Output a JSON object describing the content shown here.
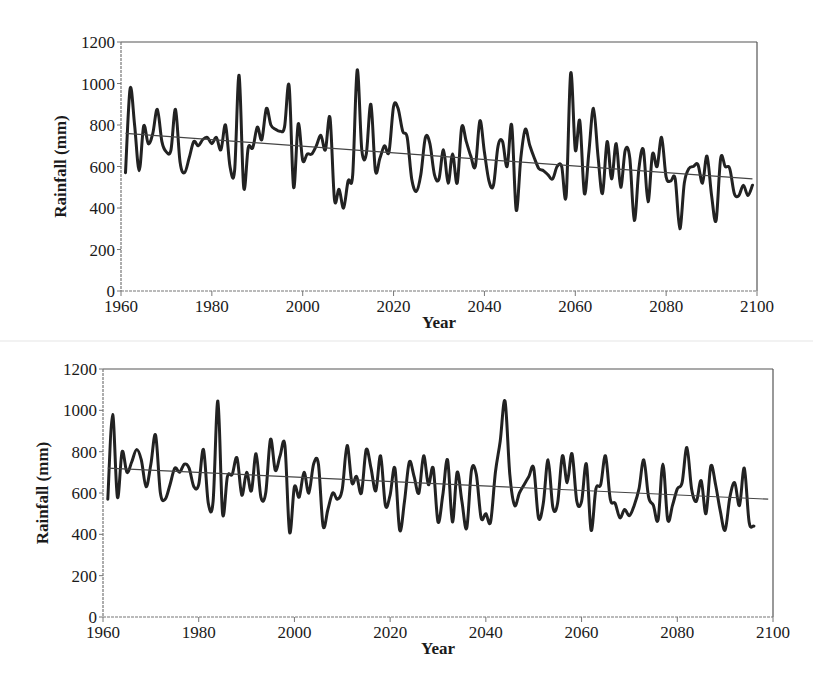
{
  "chart_data": [
    {
      "id": "top",
      "type": "line",
      "title": "",
      "xlabel": "Year",
      "ylabel": "Rainfall (mm)",
      "xlim": [
        1960,
        2100
      ],
      "ylim": [
        0,
        1200
      ],
      "x_ticks": [
        1960,
        1980,
        2000,
        2020,
        2040,
        2060,
        2080,
        2100
      ],
      "y_ticks": [
        0,
        200,
        400,
        600,
        800,
        1000,
        1200
      ],
      "grid": false,
      "legend": null,
      "frame": {
        "left": 121,
        "top": 42,
        "right": 757,
        "bottom": 291
      },
      "series": [
        {
          "name": "Annual rainfall",
          "x": [
            1961,
            1962,
            1963,
            1964,
            1965,
            1966,
            1967,
            1968,
            1969,
            1970,
            1971,
            1972,
            1973,
            1974,
            1975,
            1976,
            1977,
            1978,
            1979,
            1980,
            1981,
            1982,
            1983,
            1984,
            1985,
            1986,
            1987,
            1988,
            1989,
            1990,
            1991,
            1992,
            1993,
            1994,
            1995,
            1996,
            1997,
            1998,
            1999,
            2000,
            2001,
            2002,
            2003,
            2004,
            2005,
            2006,
            2007,
            2008,
            2009,
            2010,
            2011,
            2012,
            2013,
            2014,
            2015,
            2016,
            2017,
            2018,
            2019,
            2020,
            2021,
            2022,
            2023,
            2024,
            2025,
            2026,
            2027,
            2028,
            2029,
            2030,
            2031,
            2032,
            2033,
            2034,
            2035,
            2036,
            2037,
            2038,
            2039,
            2040,
            2041,
            2042,
            2043,
            2044,
            2045,
            2046,
            2047,
            2048,
            2049,
            2050,
            2051,
            2052,
            2053,
            2054,
            2055,
            2056,
            2057,
            2058,
            2059,
            2060,
            2061,
            2062,
            2063,
            2064,
            2065,
            2066,
            2067,
            2068,
            2069,
            2070,
            2071,
            2072,
            2073,
            2074,
            2075,
            2076,
            2077,
            2078,
            2079,
            2080,
            2081,
            2082,
            2083,
            2084,
            2085,
            2086,
            2087,
            2088,
            2089,
            2090,
            2091,
            2092,
            2093,
            2094,
            2095,
            2096,
            2097,
            2098,
            2099
          ],
          "values": [
            570,
            975,
            800,
            580,
            795,
            710,
            760,
            875,
            720,
            670,
            680,
            875,
            620,
            570,
            640,
            720,
            700,
            730,
            740,
            710,
            740,
            680,
            800,
            600,
            580,
            1040,
            500,
            690,
            690,
            790,
            730,
            880,
            800,
            780,
            770,
            790,
            990,
            500,
            805,
            630,
            660,
            660,
            700,
            750,
            680,
            835,
            440,
            490,
            400,
            530,
            560,
            1065,
            680,
            660,
            900,
            580,
            640,
            700,
            670,
            890,
            880,
            770,
            740,
            540,
            480,
            560,
            740,
            710,
            560,
            540,
            680,
            520,
            660,
            520,
            790,
            720,
            650,
            600,
            820,
            670,
            530,
            510,
            700,
            720,
            600,
            800,
            390,
            640,
            780,
            700,
            640,
            590,
            580,
            560,
            540,
            600,
            600,
            460,
            1050,
            680,
            820,
            470,
            670,
            880,
            650,
            470,
            720,
            540,
            710,
            500,
            680,
            640,
            340,
            590,
            680,
            430,
            660,
            600,
            740,
            550,
            530,
            540,
            300,
            520,
            590,
            600,
            610,
            520,
            650,
            460,
            340,
            640,
            600,
            590,
            470,
            460,
            510,
            460,
            510
          ],
          "color": "#222222"
        },
        {
          "name": "Linear trend",
          "x": [
            1961,
            2099
          ],
          "values": [
            760,
            540
          ],
          "color": "#444444"
        }
      ]
    },
    {
      "id": "bottom",
      "type": "line",
      "title": "",
      "xlabel": "Year",
      "ylabel": "Rainfall (mm)",
      "xlim": [
        1960,
        2100
      ],
      "ylim": [
        0,
        1200
      ],
      "x_ticks": [
        1960,
        1980,
        2000,
        2020,
        2040,
        2060,
        2080,
        2100
      ],
      "y_ticks": [
        0,
        200,
        400,
        600,
        800,
        1000,
        1200
      ],
      "grid": false,
      "legend": null,
      "frame": {
        "left": 103,
        "top": 369,
        "right": 773,
        "bottom": 617
      },
      "series": [
        {
          "name": "Annual rainfall",
          "x": [
            1961,
            1962,
            1963,
            1964,
            1965,
            1966,
            1967,
            1968,
            1969,
            1970,
            1971,
            1972,
            1973,
            1974,
            1975,
            1976,
            1977,
            1978,
            1979,
            1980,
            1981,
            1982,
            1983,
            1984,
            1985,
            1986,
            1987,
            1988,
            1989,
            1990,
            1991,
            1992,
            1993,
            1994,
            1995,
            1996,
            1997,
            1998,
            1999,
            2000,
            2001,
            2002,
            2003,
            2004,
            2005,
            2006,
            2007,
            2008,
            2009,
            2010,
            2011,
            2012,
            2013,
            2014,
            2015,
            2016,
            2017,
            2018,
            2019,
            2020,
            2021,
            2022,
            2023,
            2024,
            2025,
            2026,
            2027,
            2028,
            2029,
            2030,
            2031,
            2032,
            2033,
            2034,
            2035,
            2036,
            2037,
            2038,
            2039,
            2040,
            2041,
            2042,
            2043,
            2044,
            2045,
            2046,
            2047,
            2048,
            2049,
            2050,
            2051,
            2052,
            2053,
            2054,
            2055,
            2056,
            2057,
            2058,
            2059,
            2060,
            2061,
            2062,
            2063,
            2064,
            2065,
            2066,
            2067,
            2068,
            2069,
            2070,
            2071,
            2072,
            2073,
            2074,
            2075,
            2076,
            2077,
            2078,
            2079,
            2080,
            2081,
            2082,
            2083,
            2084,
            2085,
            2086,
            2087,
            2088,
            2089,
            2090,
            2091,
            2092,
            2093,
            2094,
            2095,
            2096,
            2097,
            2098,
            2099
          ],
          "values": [
            570,
            980,
            580,
            800,
            700,
            750,
            810,
            760,
            630,
            740,
            880,
            600,
            570,
            640,
            720,
            700,
            740,
            720,
            630,
            640,
            810,
            550,
            560,
            1045,
            500,
            680,
            690,
            770,
            590,
            700,
            610,
            790,
            580,
            600,
            860,
            710,
            780,
            830,
            410,
            630,
            580,
            700,
            600,
            740,
            740,
            440,
            520,
            600,
            570,
            620,
            830,
            650,
            680,
            600,
            810,
            720,
            610,
            780,
            540,
            590,
            720,
            420,
            560,
            750,
            680,
            600,
            780,
            640,
            720,
            460,
            590,
            760,
            460,
            700,
            560,
            430,
            710,
            690,
            480,
            500,
            460,
            700,
            850,
            1045,
            690,
            540,
            600,
            640,
            680,
            720,
            480,
            550,
            760,
            530,
            550,
            780,
            650,
            790,
            560,
            560,
            740,
            420,
            620,
            640,
            780,
            570,
            550,
            480,
            520,
            490,
            540,
            620,
            760,
            580,
            540,
            470,
            740,
            470,
            540,
            620,
            650,
            820,
            620,
            560,
            660,
            500,
            730,
            640,
            510,
            420,
            580,
            650,
            540,
            720,
            460,
            440,
            420
          ],
          "color": "#222222"
        },
        {
          "name": "Linear trend",
          "x": [
            1961,
            2099
          ],
          "values": [
            720,
            570
          ],
          "color": "#444444"
        }
      ]
    }
  ]
}
